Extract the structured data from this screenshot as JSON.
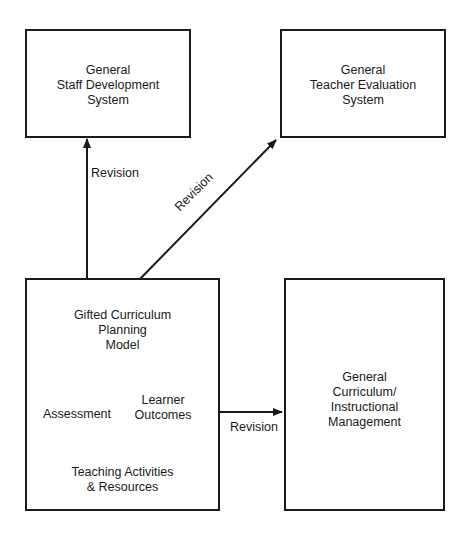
{
  "diagram": {
    "nodes": {
      "staff_development": {
        "label": "General\nStaff Development\nSystem"
      },
      "teacher_evaluation": {
        "label": "General\nTeacher Evaluation\nSystem"
      },
      "gifted_model": {
        "label": "Gifted Curriculum\nPlanning\nModel",
        "components": {
          "assessment": "Assessment",
          "learner_outcomes": "Learner\nOutcomes",
          "teaching_activities": "Teaching Activities\n& Resources"
        }
      },
      "general_curriculum": {
        "label": "General\nCurriculum/\nInstructional\nManagement"
      }
    },
    "edges": [
      {
        "from": "gifted_model",
        "to": "staff_development",
        "label": "Revision"
      },
      {
        "from": "gifted_model",
        "to": "teacher_evaluation",
        "label": "Revision"
      },
      {
        "from": "gifted_model",
        "to": "general_curriculum",
        "label": "Revision"
      }
    ],
    "colors": {
      "stroke": "#1a1a1a",
      "background": "#ffffff"
    }
  }
}
